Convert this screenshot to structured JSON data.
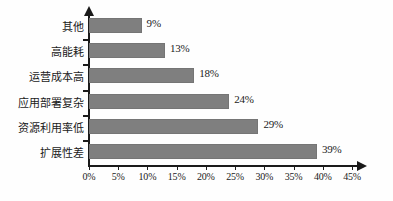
{
  "chart_data": {
    "type": "bar",
    "orientation": "horizontal",
    "title": "",
    "subtitle": "",
    "xlabel": "",
    "ylabel": "",
    "categories": [
      "扩展性差",
      "资源利用率低",
      "应用部署复杂",
      "运营成本高",
      "高能耗",
      "其他"
    ],
    "values": [
      39,
      29,
      24,
      18,
      13,
      9
    ],
    "value_labels": [
      "39%",
      "29%",
      "24%",
      "18%",
      "13%",
      "9%"
    ],
    "xlim": [
      0,
      45
    ],
    "xtick_values": [
      0,
      5,
      10,
      15,
      20,
      25,
      30,
      35,
      40,
      45
    ],
    "xtick_labels": [
      "0%",
      "5%",
      "10%",
      "15%",
      "20%",
      "25%",
      "30%",
      "35%",
      "40%",
      "45%"
    ],
    "grid": false,
    "legend": null,
    "legend_position": "none",
    "bar_color": "#7f7f7f",
    "bar_edge_color": "#757575",
    "axis_color": "#1a1a1a",
    "background_color": "#fefefe",
    "axis_arrows": true,
    "annotations": []
  },
  "axis": {
    "x_arrow_icon": "arrow-right-icon",
    "y_arrow_icon": "arrow-up-icon"
  }
}
